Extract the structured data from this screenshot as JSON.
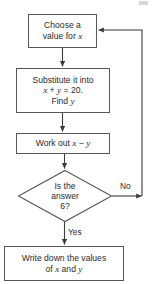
{
  "diagram": {
    "type": "flowchart",
    "title": "",
    "nodes": [
      {
        "id": "choose",
        "shape": "process",
        "text": "Choose a\nvalue for ",
        "var_suffix": "x"
      },
      {
        "id": "substitute",
        "shape": "process",
        "line1": "Substitute it into",
        "line2_x": "x",
        "line2_plus": " + ",
        "line2_y": "y",
        "line2_eq": " = 20.",
        "line3_find": "Find ",
        "line3_y": "y"
      },
      {
        "id": "workout",
        "shape": "process",
        "prefix": "Work out ",
        "var_x": "x",
        "minus": " − ",
        "var_y": "y"
      },
      {
        "id": "decision",
        "shape": "decision",
        "text": "Is the\nanswer\n6?"
      },
      {
        "id": "write",
        "shape": "process",
        "line1": "Write down the values",
        "line2_of": "of ",
        "line2_x": "x",
        "line2_and": " and ",
        "line2_y": "y"
      }
    ],
    "edge_labels": {
      "no": "No",
      "yes": "Yes"
    },
    "colors": {
      "border": "#575757",
      "connector": "#3b3b3b",
      "text": "#2b2b2b",
      "background": "#ffffff"
    }
  }
}
